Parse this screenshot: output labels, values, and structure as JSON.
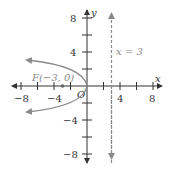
{
  "title": "",
  "axes": {
    "x_label": "x",
    "y_label": "y",
    "origin_label": "O",
    "x_ticks": [
      -8,
      -6,
      -4,
      -2,
      2,
      4,
      6,
      8
    ],
    "x_tick_labels": [
      "-8",
      "-4",
      "4",
      "8"
    ],
    "y_ticks": [
      -8,
      -6,
      -4,
      -2,
      2,
      4,
      6,
      8
    ],
    "y_tick_labels": [
      "8",
      "4",
      "-4",
      "-8"
    ],
    "range": [
      -8.5,
      8.5
    ]
  },
  "focus": {
    "label": "F(−3, 0)",
    "x": -3,
    "y": 0
  },
  "directrix": {
    "label": "x = 3",
    "x": 3,
    "style": "dashed"
  },
  "curve": {
    "equation": "y² = −12x",
    "type": "parabola",
    "opens": "left",
    "vertex": [
      0,
      0
    ]
  },
  "colors": {
    "axis": "#333333",
    "curve": "#8a8a8a",
    "directrix": "#8a8a8a",
    "focus_label": "#888888"
  },
  "labels": {
    "xm8": "−8",
    "xm4": "−4",
    "x4": "4",
    "x8": "8",
    "y8": "8",
    "y4": "4",
    "ym4": "−4",
    "ym8": "−8"
  }
}
